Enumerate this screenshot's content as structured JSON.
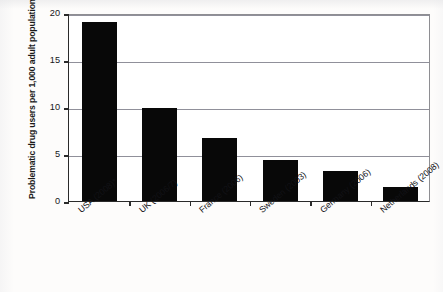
{
  "chart_data": {
    "type": "bar",
    "title": "",
    "title_note": "cut off at top edge of scan, illegible",
    "xlabel": "",
    "ylabel": "Problematic drug users per 1,000 adult population",
    "categories": [
      "USA (2008)*",
      "UK (2006/7)",
      "France (2006)",
      "Sweden (2003)",
      "Germany (2006)",
      "Netherlands (2008)"
    ],
    "values": [
      19.0,
      9.9,
      6.7,
      4.4,
      3.2,
      1.5
    ],
    "ylim": [
      0,
      20
    ],
    "yticks": [
      0,
      5,
      10,
      15,
      20
    ],
    "ytick_labels": [
      "0",
      "5",
      "10",
      "15",
      "20"
    ],
    "grid": true,
    "grid_axis": "y",
    "legend": false,
    "bar_color": "#080808",
    "background_color": "#ffffff",
    "axis_color": "#2a2a2a",
    "gridline_color": "#90909a"
  },
  "axes": {
    "y_title": "Problematic drug users per 1,000 adult population",
    "y_ticks": [
      {
        "value": 20,
        "label": "20"
      },
      {
        "value": 15,
        "label": "15"
      },
      {
        "value": 10,
        "label": "10"
      },
      {
        "value": 5,
        "label": "5"
      },
      {
        "value": 0,
        "label": "0"
      }
    ]
  },
  "bars": [
    {
      "label": "USA (2008)*",
      "value": 19.0
    },
    {
      "label": "UK (2006/7)",
      "value": 9.9
    },
    {
      "label": "France (2006)",
      "value": 6.7
    },
    {
      "label": "Sweden (2003)",
      "value": 4.4
    },
    {
      "label": "Germany (2006)",
      "value": 3.2
    },
    {
      "label": "Netherlands (2008)",
      "value": 1.5
    }
  ],
  "title": {
    "text": ""
  }
}
